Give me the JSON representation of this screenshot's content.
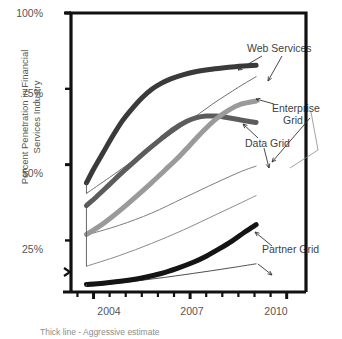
{
  "chart_data": {
    "type": "line",
    "title": "",
    "subtitle": "",
    "xlabel": "",
    "ylabel": "Percent Penetration in Financial Services Industry",
    "xlim": [
      2003.3,
      2010.6
    ],
    "ylim": [
      8,
      100
    ],
    "grid": false,
    "legend_position": "inline-annotations",
    "y_axis_break": true,
    "y_ticks": [
      {
        "value": 100,
        "label": "100%"
      },
      {
        "value": 75,
        "label": "75%"
      },
      {
        "value": 50,
        "label": "50%"
      },
      {
        "value": 25,
        "label": "25%"
      }
    ],
    "x_ticks": [
      {
        "value": 2003.5,
        "label": ""
      },
      {
        "value": 2004,
        "label": "2004"
      },
      {
        "value": 2004.5,
        "label": ""
      },
      {
        "value": 2005,
        "label": ""
      },
      {
        "value": 2005.5,
        "label": ""
      },
      {
        "value": 2006,
        "label": ""
      },
      {
        "value": 2006.5,
        "label": ""
      },
      {
        "value": 2007,
        "label": "2007"
      },
      {
        "value": 2007.5,
        "label": ""
      },
      {
        "value": 2008,
        "label": ""
      },
      {
        "value": 2008.5,
        "label": ""
      },
      {
        "value": 2009,
        "label": ""
      },
      {
        "value": 2009.5,
        "label": ""
      },
      {
        "value": 2010,
        "label": "2010"
      }
    ],
    "annotations": [
      {
        "text": "Web Services",
        "x": 2008.3,
        "y": 93
      },
      {
        "text": "Enterprise",
        "x": 2009.2,
        "y": 71
      },
      {
        "text": "Grid",
        "x": 2009.5,
        "y": 67
      },
      {
        "text": "Data Grid",
        "x": 2008.9,
        "y": 61
      },
      {
        "text": "Partner Grid",
        "x": 2009.0,
        "y": 25
      }
    ],
    "series": [
      {
        "name": "Web Services",
        "style": "Aggressive estimate",
        "line": "thick",
        "color": "#3a3a3a",
        "width": 5,
        "x": [
          2003.78,
          2004.0,
          2004.3,
          2004.6,
          2004.9,
          2005.2,
          2005.5,
          2005.8,
          2006.1,
          2006.4,
          2006.8,
          2007.2,
          2007.6,
          2008.0,
          2008.4,
          2008.8,
          2009.05
        ],
        "values": [
          44.0,
          48.5,
          54.0,
          59.5,
          64.5,
          68.5,
          72.0,
          74.8,
          76.8,
          78.3,
          79.7,
          80.7,
          81.4,
          81.9,
          82.3,
          82.6,
          82.8
        ]
      },
      {
        "name": "Web Services",
        "style": "Conservative estimate",
        "line": "thin",
        "color": "#6e6e6e",
        "width": 1,
        "x": [
          2003.78,
          2004.5,
          2005.3,
          2006.1,
          2006.9,
          2007.7,
          2008.5,
          2009.05
        ],
        "values": [
          40.5,
          45.8,
          51.8,
          57.8,
          63.8,
          70.0,
          75.5,
          79.0
        ]
      },
      {
        "name": "Data Grid",
        "style": "Aggressive estimate",
        "line": "thick",
        "color": "#5c5c5c",
        "width": 5,
        "x": [
          2003.78,
          2004.1,
          2004.5,
          2004.9,
          2005.3,
          2005.7,
          2006.1,
          2006.5,
          2006.9,
          2007.2,
          2007.5,
          2007.8,
          2008.1,
          2008.5,
          2008.8,
          2009.05
        ],
        "values": [
          36.5,
          39.5,
          43.5,
          47.5,
          51.3,
          55.0,
          58.5,
          61.8,
          64.3,
          65.5,
          66.0,
          66.0,
          65.6,
          64.9,
          64.3,
          63.9
        ]
      },
      {
        "name": "Data Grid",
        "style": "Conservative estimate",
        "line": "thin",
        "color": "#7d7d7d",
        "width": 1,
        "x": [
          2003.78,
          2004.8,
          2005.8,
          2006.8,
          2007.8,
          2008.6,
          2009.05
        ],
        "values": [
          26.8,
          30.0,
          34.0,
          39.0,
          44.0,
          47.8,
          49.5
        ]
      },
      {
        "name": "Enterprise Grid",
        "style": "Aggressive estimate",
        "line": "thick",
        "color": "#9a9a9a",
        "width": 5,
        "x": [
          2003.78,
          2004.2,
          2004.6,
          2005.0,
          2005.4,
          2005.8,
          2006.2,
          2006.6,
          2007.0,
          2007.4,
          2007.8,
          2008.2,
          2008.6,
          2009.05
        ],
        "values": [
          27.0,
          29.8,
          33.0,
          36.5,
          40.2,
          44.0,
          48.0,
          52.0,
          56.5,
          61.0,
          65.0,
          68.0,
          70.0,
          71.0
        ]
      },
      {
        "name": "Enterprise Grid",
        "style": "Conservative estimate",
        "line": "thin",
        "color": "#8a8a8a",
        "width": 1,
        "x": [
          2003.78,
          2004.8,
          2005.8,
          2006.8,
          2007.8,
          2008.6,
          2009.05
        ],
        "values": [
          16.5,
          20.0,
          24.0,
          28.5,
          33.5,
          37.5,
          39.8
        ]
      },
      {
        "name": "Partner Grid",
        "style": "Aggressive estimate",
        "line": "thick",
        "color": "#141414",
        "width": 5,
        "x": [
          2003.78,
          2004.3,
          2004.9,
          2005.5,
          2006.1,
          2006.6,
          2007.1,
          2007.5,
          2007.9,
          2008.3,
          2008.7,
          2009.05
        ],
        "values": [
          10.5,
          10.9,
          11.6,
          12.6,
          14.1,
          15.8,
          17.8,
          19.8,
          22.2,
          24.8,
          27.8,
          30.2
        ]
      },
      {
        "name": "Partner Grid",
        "style": "Conservative estimate",
        "line": "thin",
        "color": "#4f4f4f",
        "width": 1,
        "x": [
          2003.78,
          2005.0,
          2006.2,
          2007.4,
          2008.4,
          2009.05
        ],
        "values": [
          9.8,
          11.2,
          12.8,
          14.6,
          16.2,
          17.3
        ]
      }
    ],
    "footnote": "Thick line - Aggressive estimate",
    "prefix_mark": "'"
  }
}
